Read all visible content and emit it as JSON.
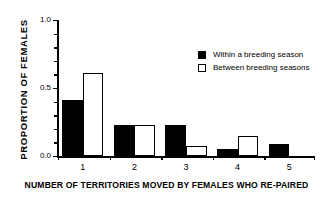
{
  "chart_data": {
    "type": "bar",
    "title": "",
    "xlabel": "NUMBER OF TERRITORIES MOVED BY FEMALES WHO RE-PAIRED",
    "ylabel": "PROPORTION  OF  FEMALES",
    "categories": [
      "1",
      "2",
      "3",
      "4",
      "5"
    ],
    "series": [
      {
        "name": "Within a breeding season",
        "color": "#000000",
        "fill": "solid",
        "values": [
          0.41,
          0.23,
          0.23,
          0.05,
          0.09
        ]
      },
      {
        "name": "Between breeding seasons",
        "color": "#ffffff",
        "fill": "hollow",
        "values": [
          0.61,
          0.23,
          0.07,
          0.15,
          0.0
        ]
      }
    ],
    "ylim": [
      0.0,
      1.0
    ],
    "ytick_labels": [
      "0.0",
      "0.5",
      "1.0"
    ],
    "ytick_values": [
      0.0,
      0.5,
      1.0
    ],
    "yminor_values": [
      0.1,
      0.2,
      0.3,
      0.4,
      0.6,
      0.7,
      0.8,
      0.9
    ],
    "grid": false,
    "legend_position": "top-right",
    "legend_entries": [
      "Within a breeding season",
      "Between breeding seasons"
    ]
  },
  "axis": {
    "y_label_text": "PROPORTION  OF  FEMALES",
    "x_label_text": "NUMBER OF TERRITORIES MOVED BY FEMALES WHO RE-PAIRED",
    "y_ticks": [
      {
        "label": "1.0",
        "value": 1.0
      },
      {
        "label": "0.5",
        "value": 0.5
      },
      {
        "label": "0.0",
        "value": 0.0
      }
    ],
    "x_ticks": [
      {
        "label": "1"
      },
      {
        "label": "2"
      },
      {
        "label": "3"
      },
      {
        "label": "4"
      },
      {
        "label": "5"
      }
    ]
  },
  "legend": {
    "items": [
      {
        "label": "Within a breeding season",
        "style": "filled"
      },
      {
        "label": "Between breeding seasons",
        "style": "hollow"
      }
    ]
  }
}
